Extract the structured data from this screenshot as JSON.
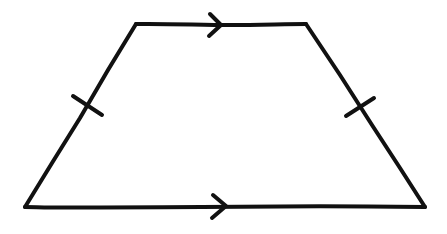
{
  "diagram": {
    "title": "Isosceles trapezoid",
    "shape": "trapezoid",
    "stroke_color": "#111111",
    "background_color": "#ffffff",
    "vertices": {
      "top_left": [
        136,
        24
      ],
      "top_right": [
        306,
        24
      ],
      "bottom_right": [
        425,
        207
      ],
      "bottom_left": [
        25,
        207
      ]
    },
    "markings": {
      "parallel_arrows": [
        {
          "side": "top",
          "position": [
            220,
            25
          ],
          "direction": "right"
        },
        {
          "side": "bottom",
          "position": [
            225,
            206
          ],
          "direction": "right"
        }
      ],
      "congruence_ticks": [
        {
          "side": "left",
          "position": [
            87,
            106
          ],
          "count": 1
        },
        {
          "side": "right",
          "position": [
            359,
            107
          ],
          "count": 1
        }
      ]
    }
  }
}
